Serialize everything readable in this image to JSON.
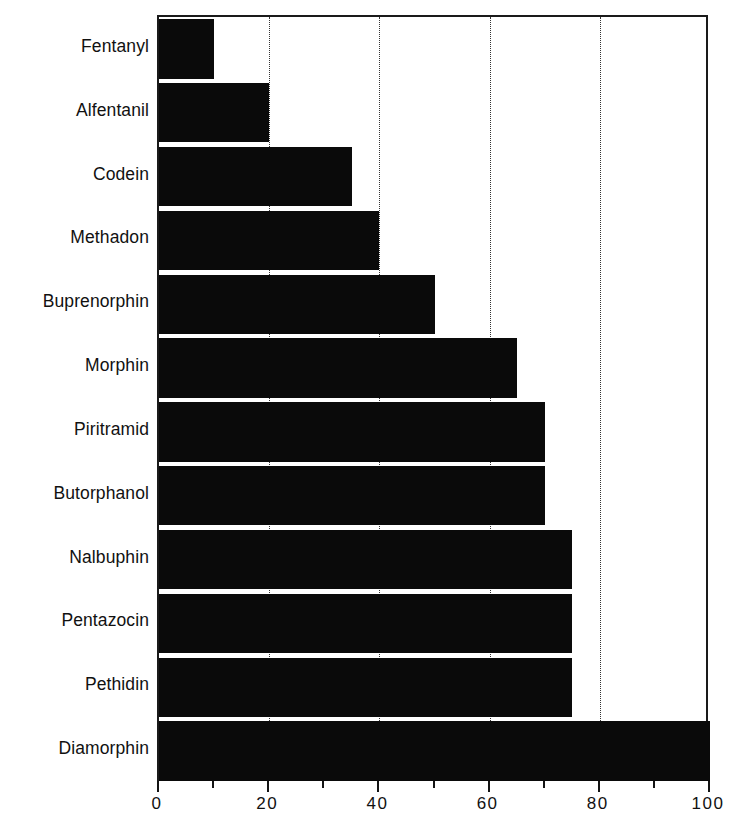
{
  "chart_data": {
    "type": "bar",
    "orientation": "horizontal",
    "title": "",
    "subtitle": "",
    "xlabel": "",
    "ylabel": "",
    "categories": [
      "Fentanyl",
      "Alfentanil",
      "Codein",
      "Methadon",
      "Buprenorphin",
      "Morphin",
      "Piritramid",
      "Butorphanol",
      "Nalbuphin",
      "Pentazocin",
      "Pethidin",
      "Diamorphin"
    ],
    "values": [
      10,
      20,
      35,
      40,
      50,
      65,
      70,
      70,
      75,
      75,
      75,
      100
    ],
    "xlim": [
      0,
      100
    ],
    "x_major_ticks": [
      0,
      20,
      40,
      60,
      80,
      100
    ],
    "x_major_tick_labels": [
      "0",
      "20",
      "40",
      "60",
      "80",
      "100"
    ],
    "x_minor_ticks": [
      10,
      30,
      50,
      70,
      90
    ],
    "gridlines_at": [
      20,
      40,
      60,
      80
    ],
    "grid": "vertical-dotted",
    "legend": "none",
    "bar_color": "#0a0a0a",
    "frame_color": "#1a1a1a",
    "background_color": "#ffffff"
  }
}
